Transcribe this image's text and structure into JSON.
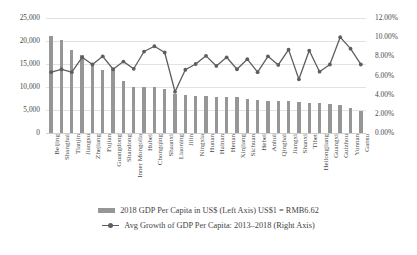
{
  "chart_data": {
    "type": "bar",
    "title": "",
    "subtitle": "",
    "xlabel": "",
    "ylabel": "",
    "y2label": "",
    "grid": true,
    "legend_position": "bottom",
    "categories": [
      "Beijing",
      "Shanghai",
      "Tianjin",
      "Jiangsu",
      "Zhejiang",
      "Fujian",
      "Guangdong",
      "Shandong",
      "Inner Mongolia",
      "Hubei",
      "Chongqing",
      "Shaanxi",
      "Liaoning",
      "Jilin",
      "Ningxia",
      "Hunan",
      "Hainan",
      "Henan",
      "Xinjiang",
      "Sichuan",
      "Hebei",
      "Anhui",
      "Qinghai",
      "Jiangxi",
      "Shanxi",
      "Tibet",
      "Heilongjiang",
      "Guangxi",
      "Guizhou",
      "Yunnan",
      "Gansu"
    ],
    "ylim": [
      0,
      25000
    ],
    "yticks": [
      "0",
      "5,000",
      "10,000",
      "15,000",
      "20,000",
      "25,000"
    ],
    "ytick_values": [
      0,
      5000,
      10000,
      15000,
      20000,
      25000
    ],
    "y2lim": [
      0,
      0.12
    ],
    "y2ticks": [
      "0.00%",
      "2.00%",
      "4.00%",
      "6.00%",
      "8.00%",
      "10.00%",
      "12.00%"
    ],
    "y2tick_values": [
      0,
      0.02,
      0.04,
      0.06,
      0.08,
      0.1,
      0.12
    ],
    "series": [
      {
        "name": "2018 GDP Per Capita in US$ (Left Axis)  US$1 = RMB6.62",
        "type": "bar",
        "axis": "left",
        "color": "#969696",
        "values": [
          21000,
          20300,
          18000,
          17000,
          14800,
          13800,
          13600,
          11400,
          10100,
          10000,
          9900,
          9500,
          8400,
          8300,
          8100,
          7950,
          7900,
          7850,
          7800,
          7500,
          7250,
          7050,
          7000,
          6950,
          6750,
          6500,
          6450,
          6200,
          6150,
          5500,
          4800
        ]
      },
      {
        "name": "Avg Growth of GDP Per Capita: 2013–2018 (Right Axis)",
        "type": "line",
        "axis": "right",
        "color": "#5e5e5e",
        "values": [
          0.0635,
          0.0665,
          0.0635,
          0.079,
          0.0715,
          0.08,
          0.0665,
          0.0745,
          0.067,
          0.085,
          0.0905,
          0.084,
          0.043,
          0.066,
          0.072,
          0.0805,
          0.07,
          0.079,
          0.0665,
          0.077,
          0.0635,
          0.08,
          0.071,
          0.087,
          0.056,
          0.086,
          0.064,
          0.0715,
          0.1,
          0.088,
          0.0715
        ]
      }
    ]
  },
  "legend": {
    "items": [
      {
        "marker": "bar-swatch",
        "label": "2018 GDP Per Capita in US$ (Left Axis)  US$1 = RMB6.62"
      },
      {
        "marker": "line-marker",
        "label": "Avg Growth of GDP Per Capita: 2013–2018 (Right Axis)"
      }
    ]
  }
}
